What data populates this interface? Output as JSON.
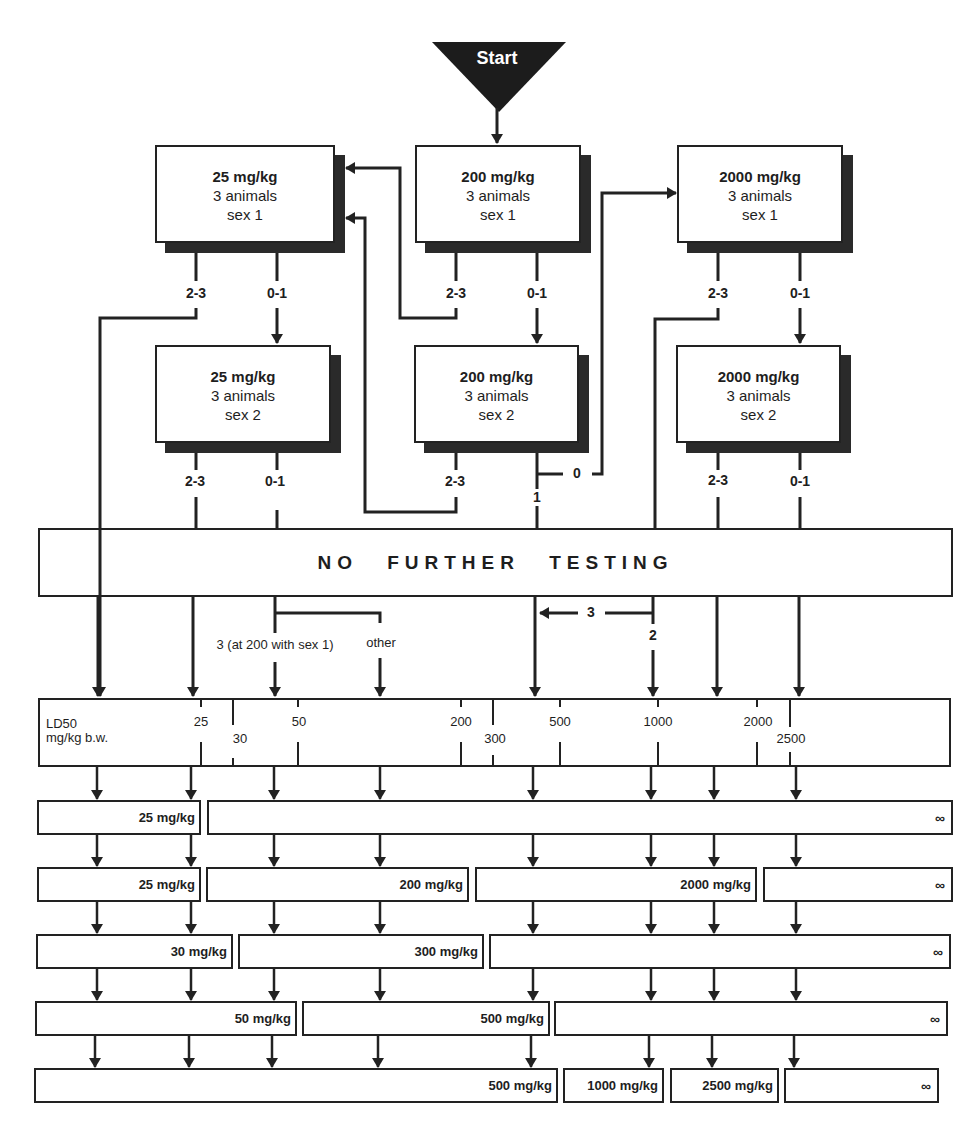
{
  "start": {
    "label": "Start"
  },
  "step_boxes": [
    {
      "id": "b25s1",
      "dose": "25 mg/kg",
      "animals": "3 animals",
      "sex": "sex 1"
    },
    {
      "id": "b200s1",
      "dose": "200 mg/kg",
      "animals": "3 animals",
      "sex": "sex 1"
    },
    {
      "id": "b2000s1",
      "dose": "2000 mg/kg",
      "animals": "3 animals",
      "sex": "sex 1"
    },
    {
      "id": "b25s2",
      "dose": "25 mg/kg",
      "animals": "3 animals",
      "sex": "sex 2"
    },
    {
      "id": "b200s2",
      "dose": "200 mg/kg",
      "animals": "3 animals",
      "sex": "sex 2"
    },
    {
      "id": "b2000s2",
      "dose": "2000 mg/kg",
      "animals": "3 animals",
      "sex": "sex 2"
    }
  ],
  "branch_labels": {
    "b25s1_a": "2-3",
    "b25s1_b": "0-1",
    "b200s1_a": "2-3",
    "b200s1_b": "0-1",
    "b2000s1_a": "2-3",
    "b2000s1_b": "0-1",
    "b25s2_a": "2-3",
    "b25s2_b": "0-1",
    "b200s2_a": "2-3",
    "b200s2_zero": "0",
    "b200s2_one": "1",
    "b2000s2_a": "2-3",
    "b2000s2_b": "0-1",
    "three": "3",
    "two": "2",
    "three_at_200": "3 (at 200 with sex 1)",
    "other": "other"
  },
  "no_further_testing": "NO FURTHER TESTING",
  "ld50_scale": {
    "title_line1": "LD50",
    "title_line2": "mg/kg b.w.",
    "ticks": [
      {
        "label": "25",
        "x": 201,
        "row": "upper"
      },
      {
        "label": "30",
        "x": 240,
        "row": "lower"
      },
      {
        "label": "50",
        "x": 298,
        "row": "upper"
      },
      {
        "label": "200",
        "x": 461,
        "row": "upper"
      },
      {
        "label": "300",
        "x": 493,
        "row": "lower"
      },
      {
        "label": "500",
        "x": 560,
        "row": "upper"
      },
      {
        "label": "1000",
        "x": 658,
        "row": "upper"
      },
      {
        "label": "2000",
        "x": 757,
        "row": "upper"
      },
      {
        "label": "2500",
        "x": 790,
        "row": "lower"
      }
    ]
  },
  "result_rows": [
    [
      {
        "label": "25 mg/kg"
      },
      {
        "label": "∞"
      }
    ],
    [
      {
        "label": "25 mg/kg"
      },
      {
        "label": "200 mg/kg"
      },
      {
        "label": "2000 mg/kg"
      },
      {
        "label": "∞"
      }
    ],
    [
      {
        "label": "30 mg/kg"
      },
      {
        "label": "300 mg/kg"
      },
      {
        "label": "∞"
      }
    ],
    [
      {
        "label": "50 mg/kg"
      },
      {
        "label": "500 mg/kg"
      },
      {
        "label": "∞"
      }
    ],
    [
      {
        "label": "500 mg/kg"
      },
      {
        "label": "1000 mg/kg"
      },
      {
        "label": "2500 mg/kg"
      },
      {
        "label": "∞"
      }
    ]
  ],
  "colors": {
    "ink": "#222222",
    "background": "#ffffff"
  }
}
